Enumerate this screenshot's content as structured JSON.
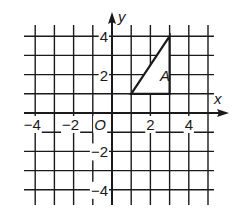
{
  "diagram": {
    "type": "coordinate-grid",
    "x_axis_label": "x",
    "y_axis_label": "y",
    "origin_label": "O",
    "x_ticks": [
      {
        "value": -4,
        "label": "-4"
      },
      {
        "value": -2,
        "label": "-2"
      },
      {
        "value": 2,
        "label": "2"
      },
      {
        "value": 4,
        "label": "4"
      }
    ],
    "y_ticks": [
      {
        "value": 4,
        "label": "4"
      },
      {
        "value": 2,
        "label": "2"
      },
      {
        "value": -2,
        "label": "-2"
      },
      {
        "value": -4,
        "label": "-4"
      }
    ],
    "grid": {
      "x_min": -4,
      "x_max": 5,
      "y_min": -4,
      "y_max": 4
    },
    "shape": {
      "name": "A",
      "type": "triangle",
      "vertices": [
        [
          1,
          1
        ],
        [
          3,
          1
        ],
        [
          3,
          4
        ]
      ]
    },
    "colors": {
      "line": "#1a1a1a",
      "background": "#ffffff"
    }
  }
}
